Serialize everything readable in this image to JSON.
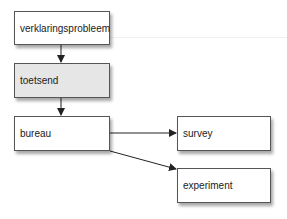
{
  "diagram": {
    "nodes": [
      {
        "id": "verklaringsprobleem",
        "label": "verklaringsprobleem",
        "fill": "#ffffff"
      },
      {
        "id": "toetsend",
        "label": "toetsend",
        "fill": "#e6e6e6"
      },
      {
        "id": "bureau",
        "label": "bureau",
        "fill": "#ffffff"
      },
      {
        "id": "survey",
        "label": "survey",
        "fill": "#ffffff"
      },
      {
        "id": "experiment",
        "label": "experiment",
        "fill": "#ffffff"
      }
    ],
    "edges": [
      {
        "from": "verklaringsprobleem",
        "to": "toetsend"
      },
      {
        "from": "toetsend",
        "to": "bureau"
      },
      {
        "from": "bureau",
        "to": "survey"
      },
      {
        "from": "bureau",
        "to": "experiment"
      }
    ]
  }
}
